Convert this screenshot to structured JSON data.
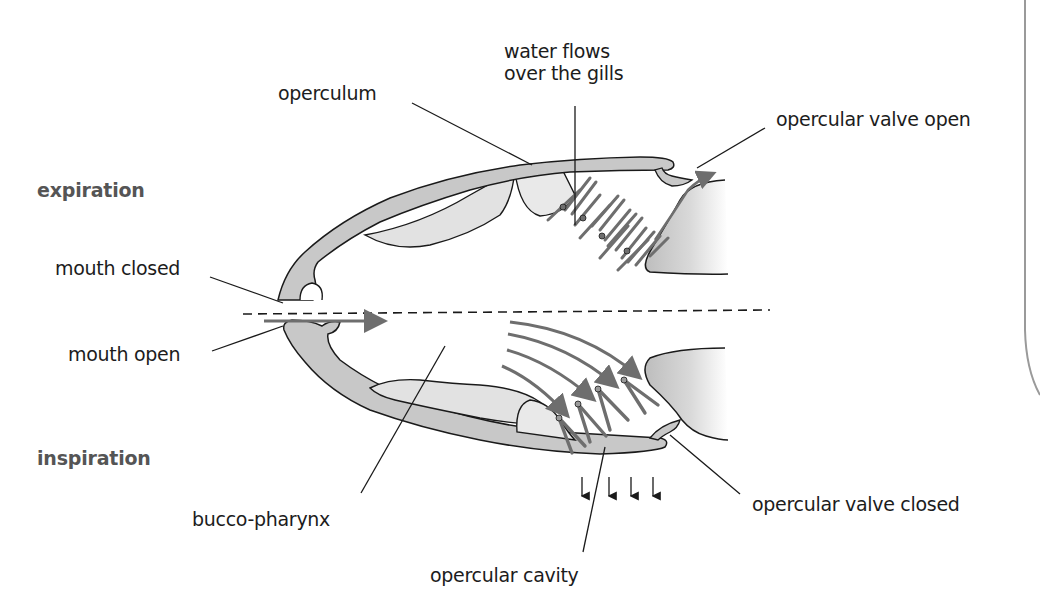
{
  "figure": {
    "phases": {
      "expiration": "expiration",
      "inspiration": "inspiration"
    },
    "labels": {
      "operculum": "operculum",
      "water_flows_line1": "water flows",
      "water_flows_line2": "over the gills",
      "opercular_valve_open": "opercular valve open",
      "mouth_closed": "mouth closed",
      "mouth_open": "mouth open",
      "bucco_pharynx": "bucco-pharynx",
      "opercular_cavity": "opercular cavity",
      "opercular_valve_closed": "opercular valve closed"
    },
    "colors": {
      "tissue_fill": "#c8c8c8",
      "tissue_light": "#e2e2e2",
      "outline": "#1a1a1a",
      "flow_arrow": "#6e6e6e",
      "phase_text": "#555555",
      "page_border": "#9a9a9a"
    },
    "pressure_arrows_count": 4,
    "gill_filament_pairs_upper": 4,
    "gill_filament_pairs_lower": 4,
    "flow_arrows_lower": 4
  }
}
